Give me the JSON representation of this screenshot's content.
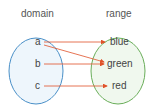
{
  "diagram": {
    "domain_title": "domain",
    "range_title": "range",
    "domain_elements": [
      "a",
      "b",
      "c"
    ],
    "range_elements": [
      "blue",
      "green",
      "red"
    ],
    "mappings": [
      {
        "from": "a",
        "to": "blue"
      },
      {
        "from": "a",
        "to": "green"
      },
      {
        "from": "b",
        "to": "green"
      },
      {
        "from": "c",
        "to": "red"
      }
    ],
    "colors": {
      "domain_border": "#4a90c8",
      "domain_fill": "#eef6fc",
      "range_border": "#6aae5a",
      "range_fill": "#f0f8ee",
      "arrow": "#e0522a"
    }
  }
}
